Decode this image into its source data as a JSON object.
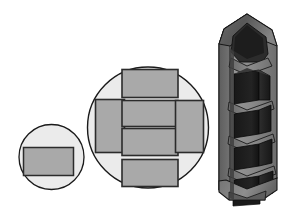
{
  "canvas": {
    "width": 288,
    "height": 211,
    "background": "#ffffff"
  },
  "palette": {
    "background": "#ffffff",
    "circle_fill": "#ebebeb",
    "circle_stroke": "#1a1a1a",
    "rect_fill": "#a9a9a9",
    "rect_stroke": "#2b2b2b",
    "shell_light": "#9a9a9a",
    "shell_mid": "#6e6e6e",
    "shell_dark": "#4a4a4a",
    "block_dark": "#1c1c1c",
    "block_darker": "#0e0e0e",
    "block_face": "#2a2a2a",
    "outline": "#000000"
  },
  "figure": {
    "type": "technical-illustration",
    "panels": [
      {
        "id": "small-circle-panel",
        "name": "small-circle",
        "label": "small circular cross-section",
        "circle": {
          "cx": 51.5,
          "cy": 157,
          "r": 32.5
        },
        "rect_count": 1,
        "rects": [
          {
            "id": "s-rect-1",
            "x": 23.5,
            "y": 147.5,
            "w": 50,
            "h": 28
          }
        ]
      },
      {
        "id": "medium-circle-panel",
        "name": "medium-circle",
        "label": "large circular cross-section",
        "circle": {
          "cx": 148,
          "cy": 127.5,
          "r": 60.5
        },
        "rect_count": 6,
        "rects": [
          {
            "id": "m-rect-top",
            "x": 122,
            "y": 69.5,
            "w": 56,
            "h": 28
          },
          {
            "id": "m-rect-left",
            "x": 95.5,
            "y": 99.5,
            "w": 29,
            "h": 53
          },
          {
            "id": "m-rect-center-1",
            "x": 122,
            "y": 100.5,
            "w": 56,
            "h": 26
          },
          {
            "id": "m-rect-center-2",
            "x": 122,
            "y": 128.5,
            "w": 56,
            "h": 27
          },
          {
            "id": "m-rect-right",
            "x": 175.5,
            "y": 100.5,
            "w": 28,
            "h": 52
          },
          {
            "id": "m-rect-bottom",
            "x": 122,
            "y": 159.5,
            "w": 56,
            "h": 27
          }
        ]
      },
      {
        "id": "column-panel",
        "name": "three-dimensional-column",
        "label": "cutaway stacked prismatic column",
        "bounds": {
          "x": 214,
          "y": 14,
          "w": 68,
          "h": 184
        },
        "stack_levels": 5,
        "has_pointed_top": true,
        "has_tapered_base": true,
        "is_cutaway": true
      }
    ]
  }
}
